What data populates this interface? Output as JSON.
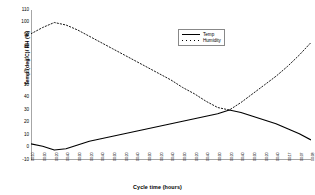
{
  "chart_data": {
    "type": "line",
    "title": "",
    "xlabel": "Cycle time (hours)",
    "ylabel": "Temp (deg C)/ RH (%)",
    "ylim": [
      -10,
      110
    ],
    "ytick_labels": [
      "110",
      "100",
      "90",
      "80",
      "70",
      "60",
      "50",
      "40",
      "30",
      "20",
      "10",
      "0",
      "-10"
    ],
    "ytick_values": [
      110,
      100,
      90,
      80,
      70,
      60,
      50,
      40,
      30,
      20,
      10,
      0,
      -10
    ],
    "grid": false,
    "legend_position": "upper-center",
    "categories": [
      "00:10",
      "00:00",
      "00:20",
      "00:40",
      "00:00",
      "00:20",
      "00:40",
      "00:00",
      "00:20",
      "00:40",
      "00:00",
      "00:20",
      "00:40",
      "00:00",
      "00:20",
      "00:40",
      "00:00",
      "00:20",
      "00:40",
      "00:00",
      "00:20",
      "00:40",
      "00:17",
      "00:07",
      "00:08"
    ],
    "series": [
      {
        "name": "Temp",
        "style": "solid",
        "color": "#000000",
        "values": [
          3,
          1,
          -2,
          -1,
          2,
          5,
          7,
          9,
          11,
          13,
          15,
          17,
          19,
          21,
          23,
          25,
          27,
          30,
          28,
          25,
          22,
          19,
          15,
          11,
          6
        ]
      },
      {
        "name": "Humidity",
        "style": "dotted",
        "color": "#000000",
        "values": [
          91,
          96,
          100,
          98,
          94,
          89,
          84,
          79,
          74,
          69,
          64,
          59,
          54,
          48,
          43,
          37,
          32,
          30,
          36,
          43,
          50,
          57,
          65,
          74,
          84
        ]
      }
    ]
  },
  "legend": {
    "items": [
      {
        "label": "Temp"
      },
      {
        "label": "Humidity"
      }
    ]
  },
  "axes": {
    "x_title": "Cycle time (hours)",
    "y_title": "Temp (deg C)/ RH (%)"
  }
}
